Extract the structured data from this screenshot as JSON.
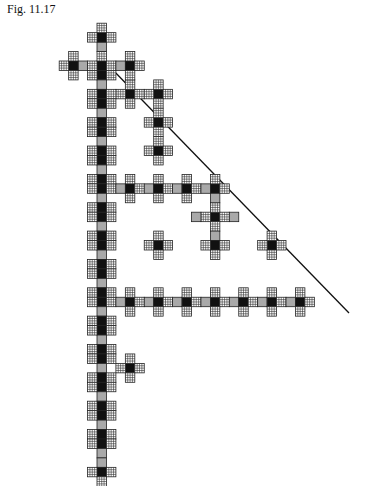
{
  "caption": "Fig. 11.17",
  "figure": {
    "unit": 9.45,
    "origin": {
      "x": 97,
      "y": 61
    },
    "colors": {
      "black": "#111111",
      "gray": "#a9a9a9",
      "grid_line": "#333333",
      "grid_bg": "#ffffff",
      "line": "#111111"
    },
    "diagonal_line": {
      "x1": 110,
      "y1": 67,
      "x2": 349,
      "y2": 313
    },
    "crosses": [
      {
        "c": 0,
        "r": 0,
        "h": 4,
        "v_up": 4,
        "v_down": 41
      },
      {
        "c": 3,
        "r": 3,
        "h": 1
      },
      {
        "c": 6,
        "r": 3,
        "h": 1
      },
      {
        "c": 6,
        "r": 6,
        "h": 1
      },
      {
        "c": 6,
        "r": 9,
        "h": 1
      },
      {
        "c": 0,
        "r": 13,
        "h": 12,
        "span_left": 0
      },
      {
        "c": 6,
        "r": 13,
        "h": 1
      },
      {
        "c": 12,
        "r": 16,
        "h": 2
      },
      {
        "c": 12,
        "r": 19,
        "h": 1
      },
      {
        "c": 6,
        "r": 19,
        "h": 1
      },
      {
        "c": 0,
        "r": 25,
        "h": 22,
        "span_left": 0
      },
      {
        "c": 18,
        "r": 19,
        "h": 1
      },
      {
        "c": 3,
        "r": 32,
        "h": 1
      }
    ]
  }
}
